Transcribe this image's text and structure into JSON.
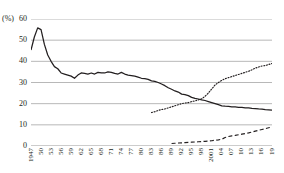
{
  "axis": {
    "unit_label": "(%)",
    "y_ticks": [
      60,
      50,
      40,
      30,
      20,
      10,
      0
    ],
    "y_min": 0,
    "y_max": 60,
    "x_tick_labels": [
      "1947",
      "50",
      "53",
      "56",
      "59",
      "62",
      "65",
      "68",
      "71",
      "74",
      "77",
      "80",
      "83",
      "86",
      "89",
      "92",
      "95",
      "98",
      "2001",
      "04",
      "07",
      "10",
      "13",
      "16",
      "19"
    ],
    "x_min": 1947,
    "x_max": 2019
  },
  "style": {
    "grid_color": "#9a9a9a",
    "line_color": "#231f20",
    "background": "#ffffff"
  },
  "chart_data": {
    "type": "line",
    "title": "",
    "xlabel": "",
    "ylabel": "",
    "unit": "%",
    "ylim": [
      0,
      60
    ],
    "xlim": [
      1947,
      2019
    ],
    "grid": true,
    "legend": "none",
    "series": [
      {
        "name": "solid-series",
        "style": "solid",
        "x": [
          1947,
          1948,
          1949,
          1950,
          1951,
          1952,
          1953,
          1954,
          1955,
          1956,
          1957,
          1958,
          1959,
          1960,
          1961,
          1962,
          1963,
          1964,
          1965,
          1966,
          1967,
          1968,
          1969,
          1970,
          1971,
          1972,
          1973,
          1974,
          1975,
          1976,
          1977,
          1978,
          1979,
          1980,
          1981,
          1982,
          1983,
          1984,
          1985,
          1986,
          1987,
          1988,
          1989,
          1990,
          1991,
          1992,
          1993,
          1994,
          1995,
          1996,
          1997,
          1998,
          1999,
          2000,
          2001,
          2002,
          2003,
          2004,
          2005,
          2006,
          2007,
          2008,
          2009,
          2010,
          2011,
          2012,
          2013,
          2014,
          2015,
          2016,
          2017,
          2018,
          2019
        ],
        "values": [
          45.3,
          51.5,
          55.8,
          55.0,
          48.0,
          43.0,
          40.0,
          37.5,
          36.5,
          34.5,
          34.0,
          33.5,
          33.0,
          32.0,
          33.5,
          34.5,
          34.3,
          34.0,
          34.5,
          34.0,
          34.8,
          34.5,
          34.5,
          35.0,
          34.8,
          34.3,
          34.0,
          34.8,
          34.0,
          33.5,
          33.3,
          33.0,
          32.5,
          32.0,
          31.8,
          31.5,
          30.8,
          30.5,
          30.0,
          29.3,
          28.5,
          27.5,
          26.8,
          26.0,
          25.5,
          24.5,
          24.3,
          23.8,
          23.0,
          22.5,
          22.2,
          21.8,
          21.5,
          21.0,
          20.5,
          20.0,
          19.5,
          19.0,
          18.8,
          18.7,
          18.5,
          18.5,
          18.3,
          18.2,
          18.0,
          18.0,
          17.8,
          17.7,
          17.5,
          17.4,
          17.2,
          17.1,
          17.0
        ]
      },
      {
        "name": "dotted-series",
        "style": "dotted",
        "x": [
          1983,
          1984,
          1985,
          1986,
          1987,
          1988,
          1989,
          1990,
          1991,
          1992,
          1993,
          1994,
          1995,
          1996,
          1997,
          1998,
          1999,
          2000,
          2001,
          2002,
          2003,
          2004,
          2005,
          2006,
          2007,
          2008,
          2009,
          2010,
          2011,
          2012,
          2013,
          2014,
          2015,
          2016,
          2017,
          2018,
          2019
        ],
        "values": [
          15.8,
          16.2,
          16.8,
          17.2,
          17.5,
          18.0,
          18.5,
          19.0,
          19.5,
          20.0,
          20.3,
          20.5,
          21.0,
          21.3,
          21.8,
          22.3,
          23.5,
          25.0,
          27.0,
          28.8,
          30.0,
          31.0,
          31.8,
          32.3,
          32.8,
          33.3,
          33.8,
          34.3,
          34.8,
          35.3,
          36.0,
          36.8,
          37.3,
          37.8,
          38.0,
          38.5,
          39.0
        ]
      },
      {
        "name": "dashed-series",
        "style": "dashed",
        "x": [
          1989,
          1990,
          1991,
          1992,
          1993,
          1994,
          1995,
          1996,
          1997,
          1998,
          1999,
          2000,
          2001,
          2002,
          2003,
          2004,
          2005,
          2006,
          2007,
          2008,
          2009,
          2010,
          2011,
          2012,
          2013,
          2014,
          2015,
          2016,
          2017,
          2018,
          2019
        ],
        "values": [
          1.2,
          1.3,
          1.4,
          1.5,
          1.6,
          1.7,
          1.8,
          1.9,
          2.0,
          2.1,
          2.2,
          2.3,
          2.5,
          2.7,
          2.9,
          3.2,
          4.0,
          4.5,
          4.8,
          5.0,
          5.3,
          5.6,
          5.9,
          6.2,
          6.6,
          7.0,
          7.4,
          7.8,
          8.2,
          8.6,
          9.0
        ]
      }
    ]
  }
}
